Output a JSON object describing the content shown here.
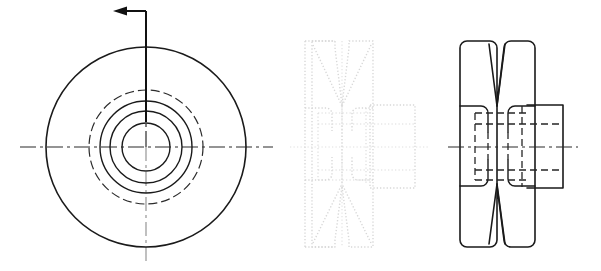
{
  "document": {
    "kind": "engineering-drawing",
    "subject": "V-groove belt pulley",
    "background_color": "#ffffff",
    "line_color": "#1a1a1a",
    "hidden_line_color": "#262626",
    "center_line_color": "#2b2b2b",
    "ghost_line_color": "#d8d8d8",
    "width": 601,
    "height": 271,
    "visible_text": []
  },
  "views": {
    "front": {
      "name": "front-view",
      "label": "",
      "center": {
        "x": 146,
        "y": 147
      },
      "circles": [
        {
          "name": "outer-rim-circle",
          "radius": 100,
          "style": "solid"
        },
        {
          "name": "groove-root-phantom-circle",
          "radius": 57,
          "style": "dashed"
        },
        {
          "name": "hub-outer-circle",
          "radius": 46,
          "style": "solid"
        },
        {
          "name": "hub-step-circle",
          "radius": 36,
          "style": "solid"
        },
        {
          "name": "bore-circle",
          "radius": 24,
          "style": "solid"
        }
      ],
      "center_lines": {
        "horizontal": {
          "x1": 20,
          "x2": 273,
          "y": 147
        },
        "vertical": {
          "y1": 38,
          "y2": 265,
          "x": 146
        }
      },
      "section_arrow": {
        "name": "section-cut-arrow",
        "direction": "left",
        "vertical_from": {
          "x": 146,
          "y": 122
        },
        "vertical_to": {
          "x": 146,
          "y": 11
        },
        "horizontal_to": {
          "x": 116,
          "y": 11
        },
        "head_size": 9
      }
    },
    "middle": {
      "name": "ghost-side-view",
      "label": "",
      "style": "faint-dotted",
      "bounds": {
        "left": 305,
        "right": 380,
        "top": 41,
        "bottom": 247
      },
      "hub_right_edge": 415,
      "axis_y": 147,
      "center_x": 342
    },
    "right": {
      "name": "side-section-view",
      "label": "",
      "bounds": {
        "left": 460,
        "right": 535,
        "top": 41,
        "bottom": 247
      },
      "hub_right_edge": 563,
      "hub_top": 105,
      "hub_bottom": 188,
      "axis_y": 147,
      "center_x": 497,
      "groove_apex_y": 105,
      "groove_apex_y_bottom": 186,
      "corner_radius": 7
    }
  },
  "line_styles": {
    "visible": {
      "name": "visible-edge",
      "width": 1.6,
      "dash": "solid"
    },
    "hidden": {
      "name": "hidden-edge",
      "width": 1.3,
      "dash": "7 4"
    },
    "center": {
      "name": "center-axis",
      "width": 1.2,
      "dash": "16 4 3 4"
    },
    "phantom": {
      "name": "phantom-edge",
      "width": 1.2,
      "dash": "9 4"
    }
  }
}
